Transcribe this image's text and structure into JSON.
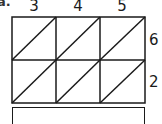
{
  "problem": {
    "label": "a.",
    "top_factor_digits": [
      "3",
      "4",
      "5"
    ],
    "side_factor_digits": [
      "6",
      "2"
    ],
    "grid": {
      "columns": 3,
      "rows": 2,
      "diagonal_direction": "bottom-left-to-top-right"
    },
    "answer": ""
  },
  "colors": {
    "line": "#1a1a1a",
    "background": "#ffffff"
  }
}
